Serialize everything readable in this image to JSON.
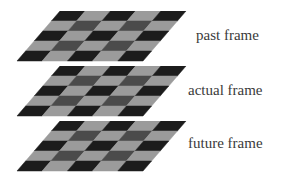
{
  "diagram": {
    "colors": {
      "dark": "#1c1c1c",
      "medium": "#4b4b4b",
      "light": "#9b9b9b",
      "label": "#3a3a3a"
    },
    "grid": {
      "rows": 5,
      "cols": 5,
      "pattern": [
        [
          "dark",
          "light",
          "dark",
          "light",
          "dark"
        ],
        [
          "light",
          "medium",
          "light",
          "medium",
          "light"
        ],
        [
          "dark",
          "light",
          "dark",
          "light",
          "dark"
        ],
        [
          "light",
          "medium",
          "light",
          "medium",
          "light"
        ],
        [
          "dark",
          "light",
          "dark",
          "light",
          "dark"
        ]
      ]
    },
    "frames": [
      {
        "label": "past frame",
        "top": 11,
        "label_x": 196,
        "label_y": 28
      },
      {
        "label": "actual frame",
        "top": 66,
        "label_x": 188,
        "label_y": 83
      },
      {
        "label": "future frame",
        "top": 121,
        "label_x": 188,
        "label_y": 136
      }
    ]
  }
}
